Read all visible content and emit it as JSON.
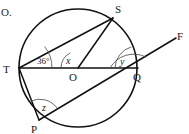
{
  "figure": {
    "corner_note": "O.",
    "points": [
      {
        "id": "S",
        "label": "S",
        "x": 113,
        "y": 18,
        "label_x": 115,
        "label_y": 13
      },
      {
        "id": "T",
        "label": "T",
        "x": 19,
        "y": 68,
        "label_x": 4,
        "label_y": 73
      },
      {
        "id": "O",
        "label": "O",
        "x": 78,
        "y": 68,
        "label_x": 69,
        "label_y": 80
      },
      {
        "id": "Q",
        "label": "Q",
        "x": 137,
        "y": 68,
        "label_x": 134,
        "label_y": 80
      },
      {
        "id": "P",
        "label": "P",
        "x": 39,
        "y": 120,
        "label_x": 32,
        "label_y": 132
      },
      {
        "id": "F",
        "label": "F",
        "x": 176,
        "y": 37,
        "label_x": 177,
        "label_y": 36
      }
    ],
    "angles": [
      {
        "id": "angle-at-T",
        "label": "36°",
        "vertex": "T",
        "label_x": 38,
        "label_y": 63
      },
      {
        "id": "angle-at-O",
        "label": "x",
        "vertex": "O",
        "label_x": 66,
        "label_y": 63
      },
      {
        "id": "angle-at-Q",
        "label": "y",
        "vertex": "Q",
        "label_x": 120,
        "label_y": 64
      },
      {
        "id": "angle-at-P",
        "label": "z",
        "vertex": "P",
        "label_x": 41,
        "label_y": 110
      }
    ],
    "circle": {
      "cx": 78,
      "cy": 68,
      "r": 59
    },
    "segments": [
      {
        "id": "segment-TS",
        "from": "T",
        "to": "S"
      },
      {
        "id": "segment-TQ",
        "from": "T",
        "to": "Q"
      },
      {
        "id": "segment-TP",
        "from": "T",
        "to": "P"
      },
      {
        "id": "segment-SO",
        "from": "S",
        "to": "O"
      },
      {
        "id": "segment-PF",
        "from": "P",
        "to": "F"
      }
    ],
    "colors": {
      "stroke": "#111111",
      "arc_stroke": "#444444",
      "text": "#1a1a1a",
      "background": "#ffffff"
    }
  }
}
